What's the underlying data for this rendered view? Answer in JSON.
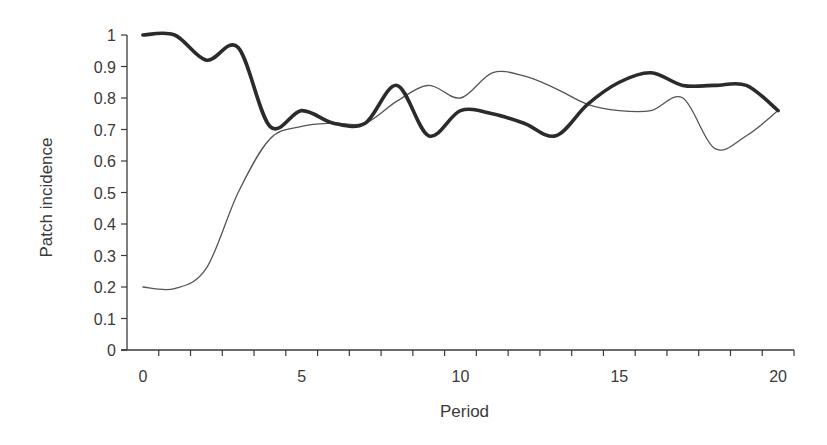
{
  "chart_data": {
    "type": "line",
    "title": "",
    "xlabel": "Period",
    "ylabel": "Patch incidence",
    "x": [
      0,
      1,
      2,
      3,
      4,
      5,
      6,
      7,
      8,
      9,
      10,
      11,
      12,
      13,
      14,
      15,
      16,
      17,
      18,
      19,
      20
    ],
    "xticks": [
      0,
      5,
      10,
      15,
      20
    ],
    "xtick_labels": [
      "0",
      "5",
      "10",
      "15",
      "20"
    ],
    "yticks": [
      0,
      0.1,
      0.2,
      0.3,
      0.4,
      0.5,
      0.6,
      0.7,
      0.8,
      0.9,
      1
    ],
    "ytick_labels": [
      "0",
      "0.1",
      "0.2",
      "0.3",
      "0.4",
      "0.5",
      "0.6",
      "0.7",
      "0.8",
      "0.9",
      "1"
    ],
    "xlim": [
      0,
      20
    ],
    "ylim": [
      0,
      1
    ],
    "grid": false,
    "legend": "none",
    "series": [
      {
        "name": "Series 1 (thick)",
        "color": "#2b2b2b",
        "style": "thick",
        "values": [
          1.0,
          1.0,
          0.92,
          0.96,
          0.71,
          0.76,
          0.72,
          0.72,
          0.84,
          0.68,
          0.76,
          0.75,
          0.72,
          0.68,
          0.78,
          0.85,
          0.88,
          0.84,
          0.84,
          0.84,
          0.76
        ]
      },
      {
        "name": "Series 2 (thin)",
        "color": "#555555",
        "style": "thin",
        "values": [
          0.2,
          0.195,
          0.26,
          0.5,
          0.67,
          0.71,
          0.72,
          0.72,
          0.79,
          0.84,
          0.8,
          0.88,
          0.87,
          0.83,
          0.78,
          0.76,
          0.76,
          0.8,
          0.64,
          0.68,
          0.76
        ]
      }
    ]
  }
}
